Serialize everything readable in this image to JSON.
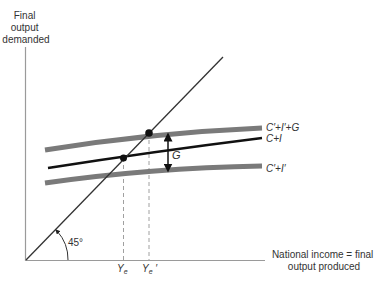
{
  "diagram": {
    "type": "keynesian-cross",
    "y_axis_label": [
      "Final",
      "output",
      "demanded"
    ],
    "x_axis_label": [
      "National income = final",
      "output produced"
    ],
    "angle_label": "45°",
    "curves": [
      {
        "id": "c_i_g",
        "label": "C′+I′+G",
        "color": "#7a7a7a",
        "width": 5
      },
      {
        "id": "c_i",
        "label": "C+I",
        "color": "#111111",
        "width": 2.5
      },
      {
        "id": "c_i_prime",
        "label": "C′+I′",
        "color": "#7a7a7a",
        "width": 5
      }
    ],
    "gap_label": "G",
    "equilibrium_labels": [
      "Ye",
      "Ye′"
    ],
    "colors": {
      "axis": "#9a9a9a",
      "diagonal": "#333333",
      "dash": "#a0a0a0",
      "text": "#333333"
    }
  }
}
